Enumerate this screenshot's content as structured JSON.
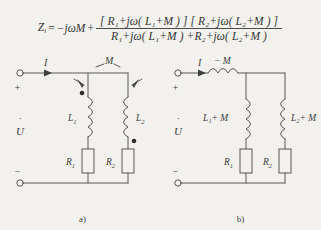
{
  "figure": {
    "formula": {
      "lhs": "Z",
      "lhs_sub": "i",
      "equals": "=",
      "lead_term": "−jωM",
      "plus": "+",
      "numerator_left_open": "[",
      "num_left": "R₁+jω( L₁+M )",
      "numerator_left_close": "]",
      "num_right_open": "[",
      "num_right": "R₂+jω( L₂+M )",
      "num_right_close": "]",
      "numerator_full": "[ R₁+jω( L₁+M ) ] [ R₂+jω( L₂+M ) ]",
      "denominator_full": "R₁+jω( L₁+M ) +R₂+jω( L₂+M )"
    },
    "circuit_a": {
      "caption": "a)",
      "terminal_plus": "+",
      "terminal_minus": "−",
      "voltage_label": "U",
      "voltage_phasor_dot": "˙",
      "current_label": "I",
      "current_phasor_dot": "˙",
      "mutual_label": "M",
      "inductor_left": "L",
      "inductor_left_sub": "1",
      "inductor_right": "L",
      "inductor_right_sub": "2",
      "resistor_left": "R",
      "resistor_left_sub": "1",
      "resistor_right": "R",
      "resistor_right_sub": "2",
      "dot_left_position": "top",
      "dot_right_position": "bottom"
    },
    "circuit_b": {
      "caption": "b)",
      "terminal_plus": "+",
      "terminal_minus": "−",
      "voltage_label": "U",
      "voltage_phasor_dot": "˙",
      "current_label": "I",
      "current_phasor_dot": "˙",
      "series_inductor_label": "− M",
      "branch_left_label": "L₁+ M",
      "branch_right_label": "L₂+ M",
      "resistor_left": "R",
      "resistor_left_sub": "1",
      "resistor_right": "R",
      "resistor_right_sub": "2"
    }
  },
  "colors": {
    "background": "#f2f1ee",
    "ink": "#3a3a3a",
    "wire": "#555555"
  }
}
